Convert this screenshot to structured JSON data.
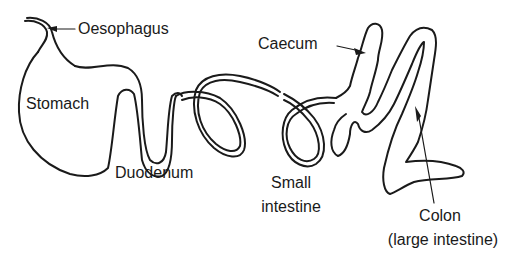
{
  "diagram": {
    "type": "anatomical line diagram",
    "colors": {
      "background": "#ffffff",
      "line": "#1a1a1a",
      "text": "#1a1a1a"
    },
    "labels": {
      "oesophagus": "Oesophagus",
      "stomach": "Stomach",
      "duodenum": "Duodenum",
      "small_intestine_1": "Small",
      "small_intestine_2": "intestine",
      "caecum": "Caecum",
      "colon_1": "Colon",
      "colon_2": "(large intestine)"
    },
    "parts": [
      "oesophagus",
      "stomach",
      "duodenum",
      "small intestine",
      "caecum",
      "colon"
    ]
  }
}
